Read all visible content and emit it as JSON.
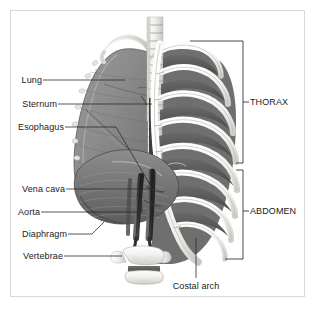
{
  "figure": {
    "background_color": "#ffffff",
    "frame_color": "#d8d8d8",
    "text_color": "#1a1a1a",
    "leader_line_color": "#2b2b2b"
  },
  "labels": {
    "lung": "Lung",
    "sternum": "Sternum",
    "esophagus": "Esophagus",
    "vena_cava": "Vena cava",
    "aorta": "Aorta",
    "diaphragm": "Diaphragm",
    "vertebrae": "Vertebrae",
    "costal_arch": "Costal arch"
  },
  "brackets": {
    "thorax": "THORAX",
    "abdomen": "ABDOMEN"
  },
  "structures": {
    "lung": "lung-illustration",
    "ribcage": "ribcage-illustration",
    "spine": "vertebral-column-illustration",
    "sternum": "sternum-illustration",
    "diaphragm": "diaphragm-illustration",
    "clavicle": "clavicle-illustration",
    "aorta": "aorta-illustration",
    "vena_cava": "vena-cava-illustration",
    "lumbar_vertebra": "lumbar-vertebra-illustration",
    "costal_arch": "costal-arch-illustration"
  }
}
